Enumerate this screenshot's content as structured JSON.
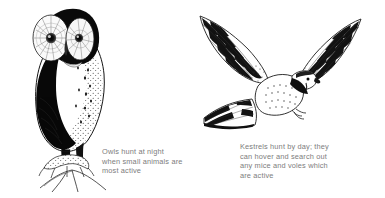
{
  "page": {
    "background_color": "#ffffff",
    "ink_color": "#1a1a1a",
    "caption_color": "#7d7d7d"
  },
  "figures": [
    {
      "id": "owl",
      "subject": "owl",
      "description": "Perched owl facing forward on a branch",
      "caption": "Owls hunt at night\nwhen small animals are\nmost active"
    },
    {
      "id": "kestrel",
      "subject": "kestrel",
      "description": "Kestrel in flight with wings raised and barred tail spread",
      "caption": "Kestrels hunt by day; they\ncan hover and search out\nany mice and voles which\nare active"
    }
  ]
}
